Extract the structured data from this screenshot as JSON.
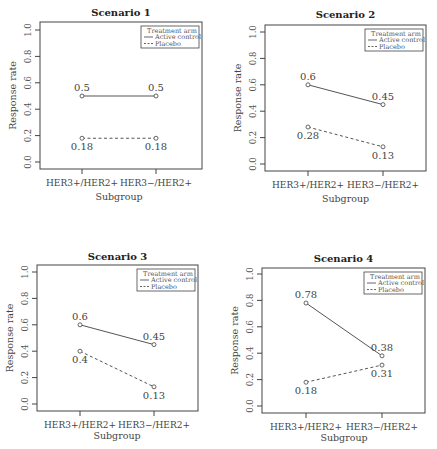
{
  "figure": {
    "panel_titles": [
      "Scenario 1",
      "Scenario 2",
      "Scenario 3",
      "Scenario 4"
    ],
    "xlabel": "Subgroup",
    "ylabel": "Response rate",
    "categories": [
      "HER3+/HER2+",
      "HER3−/HER2+"
    ],
    "yticks": [
      "0.0",
      "0.2",
      "0.4",
      "0.6",
      "0.8",
      "1.0"
    ],
    "legend": {
      "title": "Treatment arm",
      "entries": [
        "Active control",
        "Placebo"
      ]
    }
  },
  "chart_data": [
    {
      "type": "line",
      "title": "Scenario 1",
      "xlabel": "Subgroup",
      "ylabel": "Response rate",
      "categories": [
        "HER3+/HER2+",
        "HER3−/HER2+"
      ],
      "ylim": [
        0,
        1
      ],
      "yticks": [
        0.0,
        0.2,
        0.4,
        0.6,
        0.8,
        1.0
      ],
      "grid": false,
      "legend_position": "top-right",
      "legend_title": "Treatment arm",
      "series": [
        {
          "name": "Active control",
          "style": "solid",
          "values": [
            0.5,
            0.5
          ],
          "labels": [
            "0.5",
            "0.5"
          ]
        },
        {
          "name": "Placebo",
          "style": "dashed",
          "values": [
            0.18,
            0.18
          ],
          "labels": [
            "0.18",
            "0.18"
          ]
        }
      ]
    },
    {
      "type": "line",
      "title": "Scenario 2",
      "xlabel": "Subgroup",
      "ylabel": "Response rate",
      "categories": [
        "HER3+/HER2+",
        "HER3−/HER2+"
      ],
      "ylim": [
        0,
        1
      ],
      "yticks": [
        0.0,
        0.2,
        0.4,
        0.6,
        0.8,
        1.0
      ],
      "grid": false,
      "legend_position": "top-right",
      "legend_title": "Treatment arm",
      "series": [
        {
          "name": "Active control",
          "style": "solid",
          "values": [
            0.6,
            0.45
          ],
          "labels": [
            "0.6",
            "0.45"
          ]
        },
        {
          "name": "Placebo",
          "style": "dashed",
          "values": [
            0.28,
            0.13
          ],
          "labels": [
            "0.28",
            "0.13"
          ]
        }
      ]
    },
    {
      "type": "line",
      "title": "Scenario 3",
      "xlabel": "Subgroup",
      "ylabel": "Response rate",
      "categories": [
        "HER3+/HER2+",
        "HER3−/HER2+"
      ],
      "ylim": [
        0,
        1
      ],
      "yticks": [
        0.0,
        0.2,
        0.4,
        0.6,
        0.8,
        1.0
      ],
      "grid": false,
      "legend_position": "top-right",
      "legend_title": "Treatment arm",
      "series": [
        {
          "name": "Active control",
          "style": "solid",
          "values": [
            0.6,
            0.45
          ],
          "labels": [
            "0.6",
            "0.45"
          ]
        },
        {
          "name": "Placebo",
          "style": "dashed",
          "values": [
            0.4,
            0.13
          ],
          "labels": [
            "0.4",
            "0.13"
          ]
        }
      ]
    },
    {
      "type": "line",
      "title": "Scenario 4",
      "xlabel": "Subgroup",
      "ylabel": "Response rate",
      "categories": [
        "HER3+/HER2+",
        "HER3−/HER2+"
      ],
      "ylim": [
        0,
        1
      ],
      "yticks": [
        0.0,
        0.2,
        0.4,
        0.6,
        0.8,
        1.0
      ],
      "grid": false,
      "legend_position": "top-right",
      "legend_title": "Treatment arm",
      "series": [
        {
          "name": "Active control",
          "style": "solid",
          "values": [
            0.78,
            0.38
          ],
          "labels": [
            "0.78",
            "0.38"
          ]
        },
        {
          "name": "Placebo",
          "style": "dashed",
          "values": [
            0.18,
            0.31
          ],
          "labels": [
            "0.18",
            "0.31"
          ]
        }
      ]
    }
  ],
  "colors": {
    "line": "#555555",
    "box": "#444444",
    "text": "#333333"
  }
}
